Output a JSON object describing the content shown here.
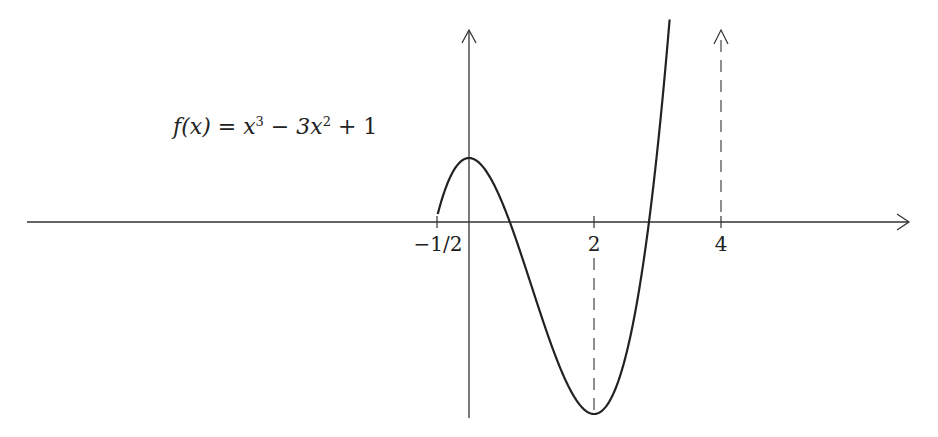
{
  "title": {
    "fn": "f(x) = x",
    "exp1": "3",
    "mid": " − 3x",
    "exp2": "2",
    "tail": " + 1"
  },
  "axis": {
    "x_ticks": [
      {
        "value": -0.5,
        "label": "−1/2"
      },
      {
        "value": 2,
        "label": "2"
      },
      {
        "value": 4,
        "label": "4"
      }
    ]
  },
  "chart_data": {
    "type": "line",
    "xlabel": "",
    "ylabel": "",
    "x_tick_labels": [
      "−1/2",
      "2",
      "4"
    ],
    "x_tick_values": [
      -0.5,
      2,
      4
    ],
    "xlim": [
      -7,
      7
    ],
    "ylim": [
      -3.2,
      3.0
    ],
    "grid": false,
    "series": [
      {
        "name": "f(x) = x^3 - 3x^2 + 1",
        "x": [
          -0.5,
          0,
          0.5,
          1,
          1.5,
          2,
          2.5,
          3,
          3.2
        ],
        "y": [
          0.125,
          1,
          0.375,
          -1,
          -2.375,
          -3,
          -2.125,
          1,
          2.05
        ]
      }
    ],
    "annotations": [
      {
        "type": "dashed-vertical",
        "x": 2,
        "from_y": 0,
        "to_y": -3
      },
      {
        "type": "dashed-vertical-arrow",
        "x": 4,
        "from_y": 0,
        "to_y": 3.0
      }
    ],
    "key_points": {
      "local_max": [
        0,
        1
      ],
      "local_min": [
        2,
        -3
      ]
    }
  }
}
